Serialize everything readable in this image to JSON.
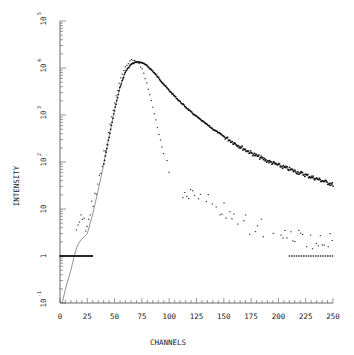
{
  "chart_data": {
    "type": "scatter",
    "title": "",
    "xlabel": "CHANNELS",
    "ylabel": "INTENSITY",
    "xlim": [
      0,
      250
    ],
    "ylim": [
      0.1,
      100000
    ],
    "yscale": "log",
    "grid": false,
    "legend": null,
    "x_ticks": [
      "0",
      "25",
      "50",
      "75",
      "100",
      "125",
      "150",
      "175",
      "200",
      "225",
      "250"
    ],
    "y_ticks": [
      "10^-1",
      "1",
      "10",
      "10^2",
      "10^3",
      "10^4",
      "10^5"
    ],
    "series": [
      {
        "name": "thin-line",
        "style": "line",
        "x": [
          2,
          5,
          8,
          10,
          13,
          16,
          20,
          25,
          30,
          35,
          40,
          45,
          50,
          55,
          60,
          65,
          70,
          75,
          80,
          85,
          90,
          95,
          100,
          110,
          120,
          130,
          140,
          150,
          160,
          170,
          180,
          190,
          200,
          210,
          220,
          230,
          240,
          250
        ],
        "y": [
          0.1,
          0.2,
          0.35,
          0.5,
          1.0,
          1.7,
          2.3,
          3.0,
          8,
          25,
          90,
          350,
          1300,
          4000,
          8500,
          12000,
          13500,
          13000,
          11000,
          8500,
          6200,
          4500,
          3300,
          1900,
          1150,
          750,
          500,
          350,
          250,
          180,
          135,
          105,
          85,
          70,
          58,
          48,
          40,
          33
        ]
      },
      {
        "name": "thick-dotted",
        "style": "heavy-points",
        "x": [
          40,
          45,
          50,
          55,
          60,
          65,
          70,
          75,
          80,
          85,
          90,
          95,
          100,
          110,
          120,
          130,
          140,
          150,
          160,
          170,
          180,
          190,
          200,
          210,
          220,
          230,
          240,
          250
        ],
        "y": [
          90,
          350,
          1300,
          4000,
          8500,
          12000,
          13500,
          13000,
          11000,
          8500,
          6200,
          4500,
          3300,
          1900,
          1150,
          750,
          500,
          350,
          250,
          180,
          135,
          105,
          85,
          70,
          58,
          48,
          40,
          33
        ]
      },
      {
        "name": "light-dotted",
        "style": "points",
        "x": [
          15,
          20,
          25,
          30,
          35,
          40,
          45,
          50,
          55,
          60,
          65,
          68,
          72,
          76,
          80,
          85,
          90,
          95,
          100,
          105,
          110,
          120,
          130,
          140,
          150,
          160,
          170,
          180,
          190,
          200,
          210,
          220,
          230,
          240,
          250
        ],
        "y": [
          3,
          5,
          6,
          10,
          30,
          120,
          500,
          1800,
          5500,
          11000,
          14500,
          15000,
          13000,
          8500,
          4200,
          1500,
          450,
          140,
          60,
          35,
          25,
          20,
          15,
          12,
          9,
          7,
          5,
          4,
          3.5,
          3,
          2.8,
          2.5,
          2.3,
          2.2,
          2
        ]
      },
      {
        "name": "baseline-ones",
        "style": "points",
        "x_ranges": [
          [
            0,
            30
          ],
          [
            210,
            250
          ]
        ],
        "y": 1
      }
    ]
  }
}
